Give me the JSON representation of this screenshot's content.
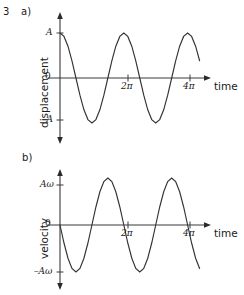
{
  "figure": {
    "question_number": "3",
    "panels": [
      {
        "id": "a",
        "label": "a)",
        "ylabel": "displacement",
        "xlabel": "time",
        "y_ticks": [
          {
            "text": "A",
            "value": 1
          },
          {
            "text": "0",
            "value": 0
          },
          {
            "text": "–A",
            "value": -1
          }
        ],
        "x_ticks": [
          {
            "text": "2π",
            "value": 6.2832
          },
          {
            "text": "4π",
            "value": 12.5664
          }
        ]
      },
      {
        "id": "b",
        "label": "b)",
        "ylabel": "velocity",
        "xlabel": "time",
        "y_ticks": [
          {
            "text": "Aω",
            "value": 1
          },
          {
            "text": "0",
            "value": 0
          },
          {
            "text": "–Aω",
            "value": -1
          }
        ],
        "x_ticks": [
          {
            "text": "2π",
            "value": 6.2832
          },
          {
            "text": "4π",
            "value": 12.5664
          }
        ]
      }
    ]
  },
  "chart_data": [
    {
      "type": "line",
      "title": "a) displacement against time for simple harmonic motion",
      "xlabel": "time",
      "ylabel": "displacement",
      "xlim": [
        0,
        13.8
      ],
      "ylim": [
        -1.18,
        1.18
      ],
      "grid": false,
      "legend": null,
      "xtick_values": [
        6.2832,
        12.5664
      ],
      "xtick_labels": [
        "2π",
        "4π"
      ],
      "ytick_values": [
        1,
        0,
        -1
      ],
      "ytick_labels": [
        "A",
        "0",
        "–A"
      ],
      "series": [
        {
          "name": "displacement",
          "equation": "x = A cos(t)",
          "amplitude": "A",
          "period": 6.2832,
          "phase": "cosine (starts at +A)",
          "color": "#333333",
          "x": [
            0.0,
            0.3927,
            0.7854,
            1.1781,
            1.5708,
            1.9635,
            2.3562,
            2.7489,
            3.1416,
            3.5343,
            3.927,
            4.3197,
            4.7124,
            5.1051,
            5.4978,
            5.8905,
            6.2832,
            6.6759,
            7.0686,
            7.4613,
            7.854,
            8.2467,
            8.6394,
            9.0321,
            9.4248,
            9.8175,
            10.2102,
            10.6029,
            10.9956,
            11.3883,
            11.781,
            12.1737,
            12.5664,
            12.9591,
            13.3518,
            13.7445
          ],
          "y": [
            1.0,
            0.924,
            0.707,
            0.383,
            0.0,
            -0.383,
            -0.707,
            -0.924,
            -1.0,
            -0.924,
            -0.707,
            -0.383,
            0.0,
            0.383,
            0.707,
            0.924,
            1.0,
            0.924,
            0.707,
            0.383,
            0.0,
            -0.383,
            -0.707,
            -0.924,
            -1.0,
            -0.924,
            -0.707,
            -0.383,
            0.0,
            0.383,
            0.707,
            0.924,
            1.0,
            0.924,
            0.707,
            0.383
          ]
        }
      ]
    },
    {
      "type": "line",
      "title": "b) velocity against time for simple harmonic motion",
      "xlabel": "time",
      "ylabel": "velocity",
      "xlim": [
        0,
        13.8
      ],
      "ylim": [
        -1.18,
        1.18
      ],
      "grid": false,
      "legend": null,
      "xtick_values": [
        6.2832,
        12.5664
      ],
      "xtick_labels": [
        "2π",
        "4π"
      ],
      "ytick_values": [
        1,
        0,
        -1
      ],
      "ytick_labels": [
        "Aω",
        "0",
        "–Aω"
      ],
      "series": [
        {
          "name": "velocity",
          "equation": "v = –Aω sin(t)",
          "amplitude": "Aω",
          "period": 6.2832,
          "phase": "negative sine (starts at 0, decreasing)",
          "color": "#333333",
          "x": [
            0.0,
            0.3927,
            0.7854,
            1.1781,
            1.5708,
            1.9635,
            2.3562,
            2.7489,
            3.1416,
            3.5343,
            3.927,
            4.3197,
            4.7124,
            5.1051,
            5.4978,
            5.8905,
            6.2832,
            6.6759,
            7.0686,
            7.4613,
            7.854,
            8.2467,
            8.6394,
            9.0321,
            9.4248,
            9.8175,
            10.2102,
            10.6029,
            10.9956,
            11.3883,
            11.781,
            12.1737,
            12.5664,
            12.9591,
            13.3518,
            13.7445
          ],
          "y": [
            0.0,
            -0.383,
            -0.707,
            -0.924,
            -1.0,
            -0.924,
            -0.707,
            -0.383,
            0.0,
            0.383,
            0.707,
            0.924,
            1.0,
            0.924,
            0.707,
            0.383,
            0.0,
            -0.383,
            -0.707,
            -0.924,
            -1.0,
            -0.924,
            -0.707,
            -0.383,
            0.0,
            0.383,
            0.707,
            0.924,
            1.0,
            0.924,
            0.707,
            0.383,
            0.0,
            -0.383,
            -0.707,
            -0.924
          ]
        }
      ]
    }
  ]
}
